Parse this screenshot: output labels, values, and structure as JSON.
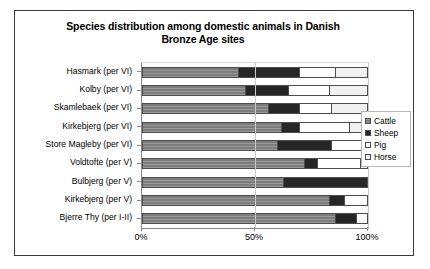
{
  "chart_data": {
    "type": "bar",
    "orientation": "horizontal",
    "stacked": true,
    "normalized": true,
    "title": "Species distribution among domestic animals in Danish Bronze Age sites",
    "title_line1": "Species distribution among domestic animals in Danish",
    "title_line2": "Bronze Age sites",
    "xlabel": "",
    "ylabel": "",
    "xlim": [
      0,
      100
    ],
    "xticks": [
      0,
      50,
      100
    ],
    "xtick_labels": [
      "0%",
      "50%",
      "100%"
    ],
    "grid": true,
    "legend_position": "right",
    "categories": [
      "Hasmark (per VI)",
      "Kolby (per VI)",
      "Skamlebaek (per VI)",
      "Kirkebjerg (per VI)",
      "Store Magleby (per VI)",
      "Voldtofte (per V)",
      "Bulbjerg (per V)",
      "Kirkebjerg (per V)",
      "Bjerre Thy (per I-II)"
    ],
    "series": [
      {
        "name": "Cattle",
        "color": "#7d7d7d",
        "pattern": "horizontal-lines",
        "values": [
          43,
          46,
          56,
          62,
          60,
          72,
          63,
          83,
          86
        ]
      },
      {
        "name": "Sheep",
        "color": "#262626",
        "pattern": "solid",
        "values": [
          27,
          19,
          14,
          8,
          24,
          6,
          37,
          7,
          9
        ]
      },
      {
        "name": "Pig",
        "color": "#ffffff",
        "pattern": "solid",
        "values": [
          16,
          18,
          14,
          22,
          16,
          19,
          0,
          10,
          5
        ]
      },
      {
        "name": "Horse",
        "color": "#f1f1f1",
        "pattern": "solid",
        "values": [
          14,
          17,
          16,
          8,
          0,
          3,
          0,
          0,
          0
        ]
      }
    ],
    "legend_entries": [
      {
        "label": "Cattle",
        "color": "#7d7d7d",
        "swatch": "hatched"
      },
      {
        "label": "Sheep",
        "color": "#262626",
        "swatch": "solid"
      },
      {
        "label": "Pig",
        "color": "#ffffff",
        "swatch": "solid"
      },
      {
        "label": "Horse",
        "color": "#f1f1f1",
        "swatch": "solid"
      }
    ]
  }
}
